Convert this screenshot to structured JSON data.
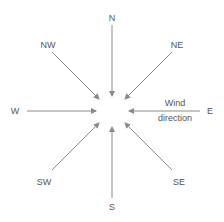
{
  "diagram": {
    "directions": [
      {
        "label": "N",
        "x": 112,
        "y": 18
      },
      {
        "label": "NE",
        "x": 177,
        "y": 45
      },
      {
        "label": "E",
        "x": 210,
        "y": 111
      },
      {
        "label": "SE",
        "x": 179,
        "y": 182
      },
      {
        "label": "S",
        "x": 112,
        "y": 207
      },
      {
        "label": "SW",
        "x": 44,
        "y": 182
      },
      {
        "label": "W",
        "x": 15,
        "y": 111
      },
      {
        "label": "NW",
        "x": 48,
        "y": 45
      }
    ],
    "annotation": {
      "line1": "Wind",
      "line2": "direction"
    },
    "arrow_color": "#8a8a8a",
    "text_color": "#555555"
  }
}
